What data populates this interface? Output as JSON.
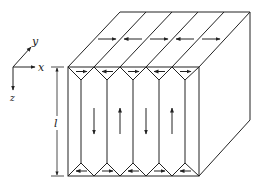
{
  "figure": {
    "axes": {
      "x_label": "x",
      "y_label": "y",
      "z_label": "z"
    },
    "dimension": {
      "label": "l",
      "meaning": "height of block"
    },
    "colors": {
      "stroke": "#222222",
      "background": "#ffffff"
    },
    "block": {
      "column_count": 5,
      "top_face_arrows": [
        "right",
        "left",
        "right",
        "left",
        "right"
      ],
      "front_top_closure_arrows": [
        "right",
        "left",
        "right",
        "left",
        "right"
      ],
      "front_bottom_closure_arrows": [
        "left",
        "right",
        "left",
        "right",
        "left"
      ],
      "main_domain_arrows": [
        "down",
        "up",
        "down",
        "up"
      ]
    }
  }
}
